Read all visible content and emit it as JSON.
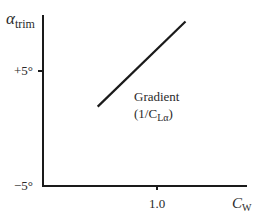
{
  "chart_data": {
    "type": "line",
    "title": "",
    "xlabel": "C",
    "xlabel_sub": "W",
    "ylabel": "α",
    "ylabel_sub": "trim",
    "xlim": [
      0,
      1.8
    ],
    "ylim": [
      -5,
      10
    ],
    "x_ticks": [
      {
        "value": 1.0,
        "label": "1.0"
      }
    ],
    "y_ticks": [
      {
        "value": 5,
        "label": "+5°"
      },
      {
        "value": -5,
        "label": "−5°"
      }
    ],
    "grid": false,
    "legend": "none",
    "series": [
      {
        "name": "trim line",
        "x": [
          0.48,
          1.25
        ],
        "y": [
          1.9,
          9.3
        ]
      }
    ],
    "annotations": [
      {
        "text_line1": "Gradient",
        "text_line2_prefix": "(1/C",
        "text_line2_sub": "Lα",
        "text_line2_suffix": ")"
      }
    ]
  }
}
